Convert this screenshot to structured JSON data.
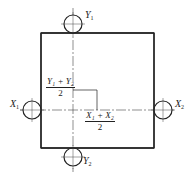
{
  "diagram": {
    "type": "engineering-drawing",
    "colors": {
      "line": "#222222",
      "background": "#ffffff"
    },
    "points": [
      {
        "id": "Y1",
        "base": "Y",
        "sub": "1",
        "position": "top"
      },
      {
        "id": "Y2",
        "base": "Y",
        "sub": "2",
        "position": "bottom"
      },
      {
        "id": "X1",
        "base": "X",
        "sub": "1",
        "position": "left"
      },
      {
        "id": "X2",
        "base": "X",
        "sub": "2",
        "position": "right"
      }
    ],
    "formulas": {
      "y_center": {
        "numerator": "Y₁ + Y₂",
        "denominator": "2"
      },
      "x_center": {
        "numerator": "X₁ + X₂",
        "denominator": "2"
      }
    }
  }
}
